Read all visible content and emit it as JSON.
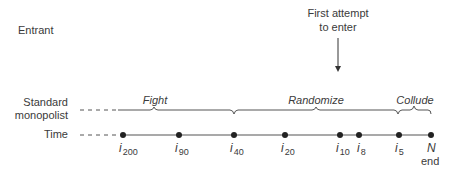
{
  "rows": {
    "entrant": "Entrant",
    "monopolist_line1": "Standard",
    "monopolist_line2": "monopolist",
    "time": "Time"
  },
  "annotation": {
    "line1": "First attempt",
    "line2": "to enter"
  },
  "phases": [
    {
      "label": "Fight"
    },
    {
      "label": "Randomize"
    },
    {
      "label": "Collude"
    }
  ],
  "timeline": {
    "points": [
      {
        "var": "i",
        "sub": "200"
      },
      {
        "var": "i",
        "sub": "90"
      },
      {
        "var": "i",
        "sub": "40"
      },
      {
        "var": "i",
        "sub": "20"
      },
      {
        "var": "i",
        "sub": "10"
      },
      {
        "var": "i",
        "sub": "8"
      },
      {
        "var": "i",
        "sub": "5"
      },
      {
        "var": "N",
        "sub": ""
      }
    ],
    "end_label": "end"
  },
  "colors": {
    "line": "#555555",
    "dot": "#222222",
    "text": "#3a3a3a"
  }
}
